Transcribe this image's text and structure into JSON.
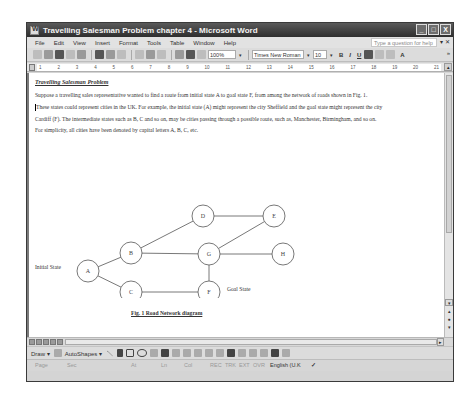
{
  "window": {
    "title": "Travelling Salesman Problem chapter 4 - Microsoft Word",
    "controls": {
      "minimize": "_",
      "maximize": "□",
      "close": "X"
    }
  },
  "menubar": {
    "items": [
      "File",
      "Edit",
      "View",
      "Insert",
      "Format",
      "Tools",
      "Table",
      "Window",
      "Help"
    ],
    "help_placeholder": "Type a question for help",
    "help_dropdown": "▾",
    "close_doc": "✕"
  },
  "toolbar": {
    "zoom": "100%",
    "font": "Times New Roman",
    "size": "10",
    "bold": "B",
    "italic": "I",
    "underline": "U",
    "font_color": "A",
    "more": "»"
  },
  "ruler": {
    "marks": [
      "1",
      "2",
      "3",
      "4",
      "5",
      "6",
      "7",
      "8",
      "9",
      "10",
      "11",
      "12",
      "13",
      "14",
      "15",
      "16",
      "17",
      "18",
      "19",
      "20",
      "21"
    ]
  },
  "document": {
    "heading": "Travelling Salesman Problem",
    "lines": [
      "Suppose a travelling sales representative wanted to find a route from initial state A to goal state F, from among the network of roads shown in Fig. 1.",
      "These states could represent cities in the UK. For example, the initial state (A) might represent the city Sheffield and the goal state might represent the city",
      "Cardiff (F). The intermediate states such as B, C and so on, may be cities passing through a possible route, such as, Manchester, Birmingham, and so on.",
      "For simplicity, all cities have been denoted by capital letters A, B, C, etc."
    ],
    "diagram": {
      "nodes": [
        {
          "id": "A",
          "x": 59,
          "y": 123
        },
        {
          "id": "B",
          "x": 102,
          "y": 105
        },
        {
          "id": "C",
          "x": 102,
          "y": 144
        },
        {
          "id": "D",
          "x": 174,
          "y": 68
        },
        {
          "id": "E",
          "x": 245,
          "y": 68
        },
        {
          "id": "G",
          "x": 180,
          "y": 106
        },
        {
          "id": "H",
          "x": 254,
          "y": 106
        },
        {
          "id": "F",
          "x": 180,
          "y": 144
        }
      ],
      "edges": [
        [
          "A",
          "B"
        ],
        [
          "A",
          "C"
        ],
        [
          "B",
          "D"
        ],
        [
          "B",
          "G"
        ],
        [
          "D",
          "E"
        ],
        [
          "G",
          "E"
        ],
        [
          "G",
          "H"
        ],
        [
          "G",
          "F"
        ],
        [
          "C",
          "F"
        ]
      ],
      "initial_label": "Initial State",
      "goal_label": "Goal State"
    },
    "caption": "Fig. 1 Road Network diagram"
  },
  "drawbar": {
    "draw": "Draw ▾",
    "autoshapes": "AutoShapes ▾"
  },
  "statusbar": {
    "page": "Page",
    "sec": "Sec",
    "at": "At",
    "ln": "Ln",
    "col": "Col",
    "rec": "REC",
    "trk": "TRK",
    "ext": "EXT",
    "ovr": "OVR",
    "language": "English (U.K"
  }
}
